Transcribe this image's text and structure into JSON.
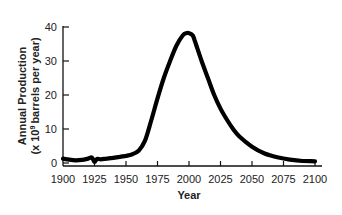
{
  "chart_data": {
    "type": "line",
    "title": "",
    "xlabel": "Year",
    "ylabel": "Annual Production",
    "ylabel_line2": "(x 10⁹ barrels per year)",
    "xlim": [
      1900,
      2100
    ],
    "ylim": [
      0,
      40
    ],
    "grid": false,
    "legend": null,
    "x_ticks": [
      1900,
      1925,
      1950,
      1975,
      2000,
      2025,
      2050,
      2075,
      2100
    ],
    "y_ticks": [
      0,
      10,
      20,
      30,
      40
    ],
    "series": [
      {
        "name": "Annual Production",
        "color": "#000000",
        "x": [
          1900,
          1905,
          1910,
          1915,
          1920,
          1923,
          1925,
          1927,
          1930,
          1935,
          1940,
          1945,
          1950,
          1955,
          1960,
          1965,
          1970,
          1975,
          1980,
          1985,
          1990,
          1995,
          1998,
          2000,
          2003,
          2005,
          2010,
          2015,
          2020,
          2025,
          2030,
          2035,
          2040,
          2050,
          2060,
          2070,
          2080,
          2090,
          2100
        ],
        "values": [
          1.3,
          1.0,
          0.8,
          0.9,
          1.3,
          1.6,
          0.3,
          1.2,
          1.1,
          1.3,
          1.5,
          1.8,
          2.1,
          2.6,
          3.6,
          6.5,
          12.5,
          19.0,
          25.0,
          30.0,
          34.5,
          37.5,
          38.2,
          38.2,
          37.5,
          35.5,
          30.0,
          25.0,
          20.0,
          16.0,
          12.8,
          10.0,
          7.8,
          4.8,
          2.8,
          1.7,
          1.0,
          0.6,
          0.5
        ]
      }
    ]
  },
  "axes": {
    "x_title": "Year",
    "y_title_line1": "Annual Production",
    "y_title_line2_prefix": "(x 10",
    "y_title_line2_sup": "9",
    "y_title_line2_suffix": "barrels per year)"
  }
}
